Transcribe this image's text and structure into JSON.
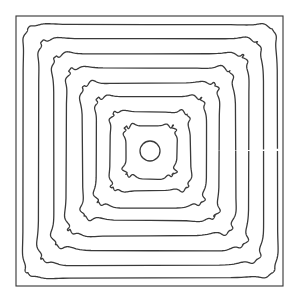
{
  "diagram": {
    "type": "nested-contours",
    "canvas": {
      "width": 299,
      "height": 302,
      "background": "#ffffff"
    },
    "line_color": "#3a3a3a",
    "frame": {
      "x": 16,
      "y": 16,
      "width": 267,
      "height": 270,
      "color": "#333333"
    },
    "center": {
      "x": 150,
      "y": 151
    },
    "center_circle": {
      "rx": 10,
      "ry": 10
    },
    "contours": [
      {
        "half_w": 127,
        "half_h": 127,
        "corner": 12,
        "wave": 0.8,
        "phase": 0.3
      },
      {
        "half_w": 112,
        "half_h": 113,
        "corner": 11,
        "wave": 1.2,
        "phase": 1.1
      },
      {
        "half_w": 98,
        "half_h": 98,
        "corner": 10,
        "wave": 1.4,
        "phase": 2.0
      },
      {
        "half_w": 84,
        "half_h": 84,
        "corner": 10,
        "wave": 1.5,
        "phase": 0.7
      },
      {
        "half_w": 69,
        "half_h": 69,
        "corner": 9,
        "wave": 1.5,
        "phase": 2.6
      },
      {
        "half_w": 55,
        "half_h": 55,
        "corner": 8,
        "wave": 1.4,
        "phase": 1.5
      },
      {
        "half_w": 40,
        "half_h": 40,
        "corner": 8,
        "wave": 1.3,
        "phase": 0.2
      },
      {
        "half_w": 26,
        "half_h": 26,
        "corner": 7,
        "wave": 1.6,
        "phase": 1.9
      }
    ]
  }
}
